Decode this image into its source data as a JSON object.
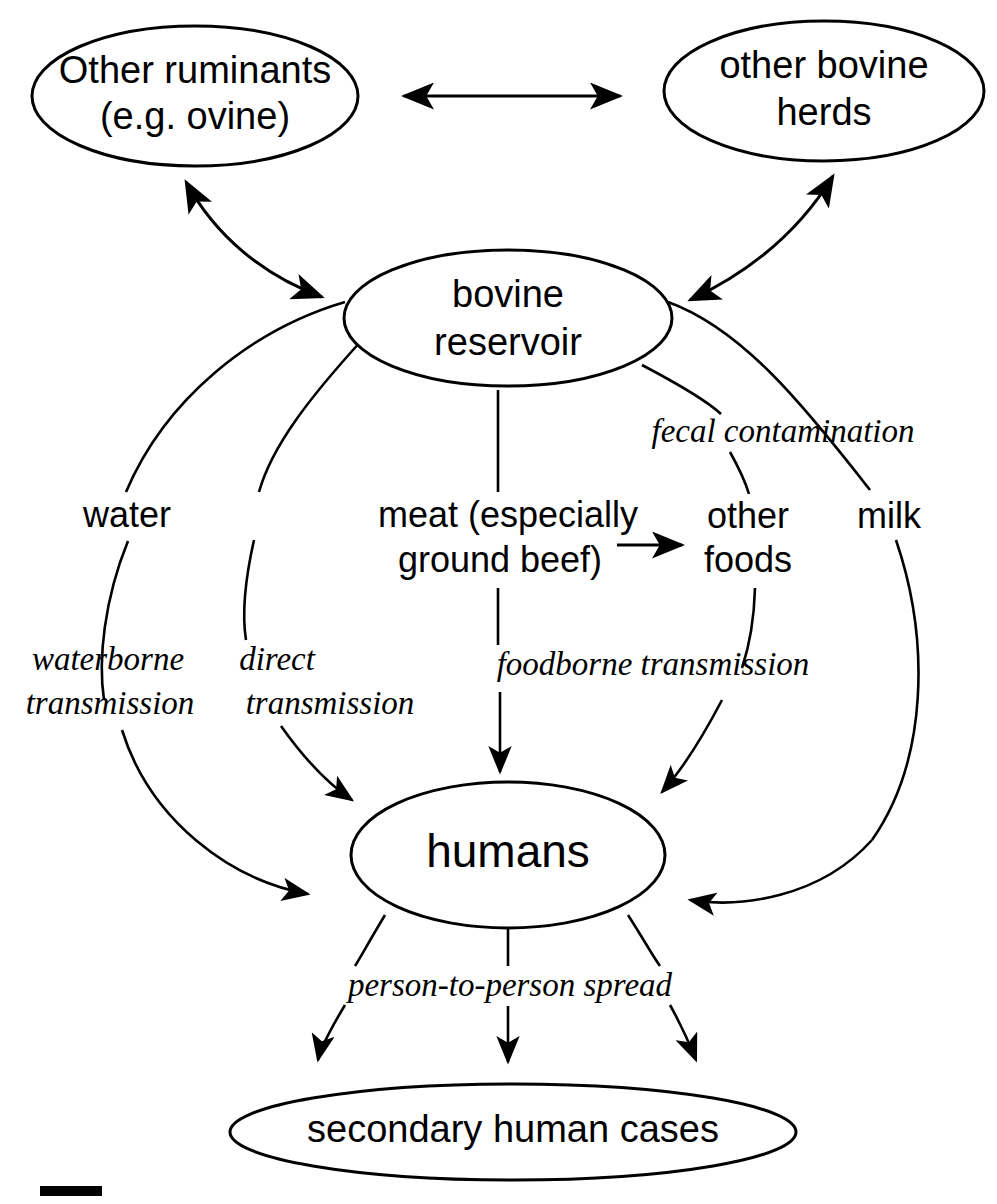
{
  "diagram": {
    "type": "flow-diagram",
    "background_color": "#ffffff",
    "stroke_color": "#000000",
    "nodes": [
      {
        "id": "other-ruminants",
        "lines": [
          "Other ruminants",
          "(e.g. ovine)"
        ],
        "shape": "ellipse",
        "cx": 195,
        "cy": 96,
        "rx": 163,
        "ry": 70,
        "font_size": 38
      },
      {
        "id": "other-bovine-herds",
        "lines": [
          "other bovine",
          "herds"
        ],
        "shape": "ellipse",
        "cx": 824,
        "cy": 91,
        "rx": 160,
        "ry": 70,
        "font_size": 38
      },
      {
        "id": "bovine-reservoir",
        "lines": [
          "bovine",
          "reservoir"
        ],
        "shape": "ellipse",
        "cx": 508,
        "cy": 318,
        "rx": 164,
        "ry": 68,
        "font_size": 38
      },
      {
        "id": "humans",
        "lines": [
          "humans"
        ],
        "shape": "ellipse",
        "cx": 508,
        "cy": 855,
        "rx": 157,
        "ry": 73,
        "font_size": 46
      },
      {
        "id": "secondary-human-cases",
        "lines": [
          "secondary human cases"
        ],
        "shape": "ellipse",
        "cx": 513,
        "cy": 1132,
        "rx": 283,
        "ry": 48,
        "font_size": 38
      }
    ],
    "edge_labels": [
      {
        "id": "water",
        "text": "water",
        "x": 127,
        "y": 517,
        "style": "plain",
        "font_size": 36
      },
      {
        "id": "meat",
        "text": "meat (especially",
        "x": 508,
        "y": 517,
        "style": "plain",
        "font_size": 36
      },
      {
        "id": "meat-line2",
        "text": "ground beef)",
        "x": 500,
        "y": 562,
        "style": "plain",
        "font_size": 36
      },
      {
        "id": "other-foods",
        "text": "other",
        "x": 748,
        "y": 518,
        "style": "plain",
        "font_size": 36
      },
      {
        "id": "other-foods-line2",
        "text": "foods",
        "x": 748,
        "y": 562,
        "style": "plain",
        "font_size": 36
      },
      {
        "id": "milk",
        "text": "milk",
        "x": 889,
        "y": 518,
        "style": "plain",
        "font_size": 36
      },
      {
        "id": "fecal-contamination",
        "text": "fecal contamination",
        "x": 783,
        "y": 434,
        "style": "italic",
        "font_size": 33
      },
      {
        "id": "waterborne-1",
        "text": "waterborne",
        "x": 108,
        "y": 662,
        "style": "italic",
        "font_size": 33
      },
      {
        "id": "waterborne-2",
        "text": "transmission",
        "x": 110,
        "y": 706,
        "style": "italic",
        "font_size": 33
      },
      {
        "id": "direct-1",
        "text": "direct",
        "x": 277,
        "y": 662,
        "style": "italic",
        "font_size": 33
      },
      {
        "id": "direct-2",
        "text": "transmission",
        "x": 330,
        "y": 706,
        "style": "italic",
        "font_size": 33
      },
      {
        "id": "foodborne",
        "text": "foodborne transmission",
        "x": 653,
        "y": 667,
        "style": "italic",
        "font_size": 33
      },
      {
        "id": "person-to-person",
        "text": "person-to-person spread",
        "x": 510,
        "y": 988,
        "style": "italic",
        "font_size": 33
      }
    ],
    "edges": [
      {
        "id": "ruminants-bovine",
        "from": "other-ruminants",
        "to": "bovine-reservoir",
        "arrows": "both",
        "label": ""
      },
      {
        "id": "ruminants-herds",
        "from": "other-ruminants",
        "to": "other-bovine-herds",
        "arrows": "both",
        "label": ""
      },
      {
        "id": "herds-bovine",
        "from": "other-bovine-herds",
        "to": "bovine-reservoir",
        "arrows": "both",
        "label": ""
      },
      {
        "id": "bovine-water-humans",
        "from": "bovine-reservoir",
        "to": "humans",
        "arrows": "forward",
        "label": "water / waterborne transmission"
      },
      {
        "id": "bovine-direct-humans",
        "from": "bovine-reservoir",
        "to": "humans",
        "arrows": "forward",
        "label": "direct transmission"
      },
      {
        "id": "bovine-meat-humans",
        "from": "bovine-reservoir",
        "to": "humans",
        "arrows": "forward",
        "label": "meat (especially ground beef) / foodborne transmission"
      },
      {
        "id": "bovine-foods-humans",
        "from": "bovine-reservoir",
        "to": "humans",
        "arrows": "forward",
        "label": "fecal contamination / other foods"
      },
      {
        "id": "meat-other-foods",
        "from": "meat",
        "to": "other-foods",
        "arrows": "forward",
        "label": ""
      },
      {
        "id": "bovine-milk-humans",
        "from": "bovine-reservoir",
        "to": "humans",
        "arrows": "forward",
        "label": "milk"
      },
      {
        "id": "humans-secondary-l",
        "from": "humans",
        "to": "secondary-human-cases",
        "arrows": "forward",
        "label": "person-to-person spread"
      },
      {
        "id": "humans-secondary-c",
        "from": "humans",
        "to": "secondary-human-cases",
        "arrows": "forward",
        "label": "person-to-person spread"
      },
      {
        "id": "humans-secondary-r",
        "from": "humans",
        "to": "secondary-human-cases",
        "arrows": "forward",
        "label": "person-to-person spread"
      }
    ],
    "scale_bar": {
      "x": 40,
      "y": 1186,
      "width": 62,
      "height": 10
    }
  }
}
